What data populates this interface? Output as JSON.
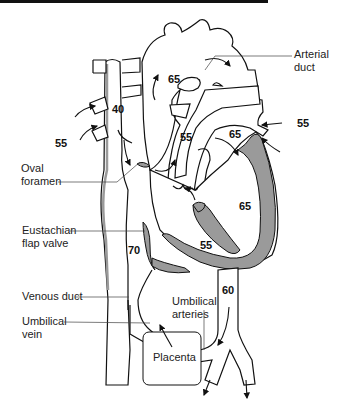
{
  "figure": {
    "colors": {
      "line": "#111111",
      "myocardium": "#9a9a9a",
      "background": "#ffffff"
    }
  },
  "labels": {
    "arterial_duct": [
      "Arterial",
      "duct"
    ],
    "oval_foramen": [
      "Oval",
      "foramen"
    ],
    "eustachian_valve": [
      "Eustachian",
      "flap valve"
    ],
    "venous_duct": "Venous duct",
    "umbilical_vein": [
      "Umbilical",
      "vein"
    ],
    "umbilical_arteries": [
      "Umbilical",
      "arteries"
    ],
    "placenta": "Placenta"
  },
  "saturations": {
    "svc": "40",
    "aorta": "65",
    "pulmonary_veins_in": "55",
    "svc_inflow": "55",
    "pulmonary_artery": "55",
    "left_atrium": "65",
    "left_ventricle": "65",
    "right_ventricle": "55",
    "ivc": "70",
    "descending_aorta": "60"
  }
}
